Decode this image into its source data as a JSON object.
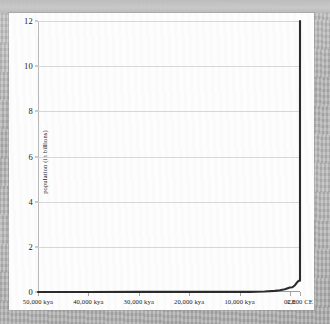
{
  "figure": {
    "background_color": "#b0b0b0",
    "card_color": "#fdfdfd",
    "line_color": "#2b2b2b",
    "grid_color": "#d6d6d6",
    "axis_color": "#9a9a9a"
  },
  "chart_data": {
    "type": "line",
    "title": "",
    "subtitle": "",
    "xlabel": "",
    "ylabel": "population (in billions)",
    "grid": "horizontal",
    "legend": "none",
    "ylim": [
      0,
      12
    ],
    "yticks": [
      "0",
      "2",
      "4",
      "6",
      "8",
      "10",
      "12"
    ],
    "ytick_values": [
      0,
      2,
      4,
      6,
      8,
      10,
      12
    ],
    "xlim": [
      -50000,
      2000
    ],
    "xtick_labels": [
      "50,000 kya",
      "40,000 kya",
      "30,000 kya",
      "20,000 kya",
      "10,000 kya",
      "0CE",
      "2,000 CE"
    ],
    "xtick_values": [
      -50000,
      -40000,
      -30000,
      -20000,
      -10000,
      0,
      2000
    ],
    "series": [
      {
        "name": "world population",
        "x": [
          -50000,
          -40000,
          -30000,
          -20000,
          -12000,
          -10000,
          -8000,
          -5000,
          -3000,
          -2000,
          -1000,
          0,
          500,
          1000,
          1500,
          1800,
          1900,
          1950,
          1980,
          1995,
          2000,
          2000
        ],
        "y": [
          0.002,
          0.003,
          0.004,
          0.005,
          0.005,
          0.006,
          0.007,
          0.02,
          0.05,
          0.08,
          0.12,
          0.2,
          0.21,
          0.3,
          0.45,
          0.5,
          0.5,
          0.5,
          0.5,
          0.5,
          0.5,
          12
        ]
      }
    ]
  }
}
